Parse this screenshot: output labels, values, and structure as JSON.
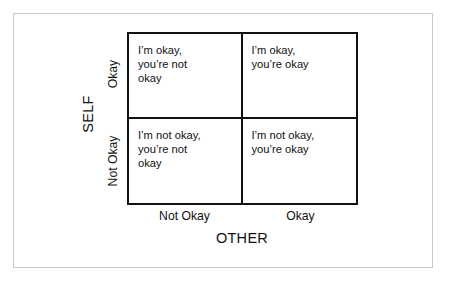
{
  "figure": {
    "title": "",
    "colors": {
      "background": "#ffffff",
      "frame": "#c9c9c9",
      "matrix_border": "#111111",
      "text": "#111111"
    }
  },
  "axes": {
    "y": {
      "title": "SELF",
      "ticks": [
        {
          "key": "okay",
          "label": "Okay"
        },
        {
          "key": "not_okay",
          "label": "Not Okay"
        }
      ]
    },
    "x": {
      "title": "OTHER",
      "ticks": [
        {
          "key": "not_okay",
          "label": "Not Okay"
        },
        {
          "key": "okay",
          "label": "Okay"
        }
      ]
    }
  },
  "chart_data": {
    "type": "table",
    "title": "",
    "xlabel": "OTHER",
    "ylabel": "SELF",
    "grid": true,
    "legend": "none",
    "x_categories": [
      "Not Okay",
      "Okay"
    ],
    "y_categories": [
      "Okay",
      "Not Okay"
    ],
    "cells": [
      {
        "row": "Okay",
        "col": "Not Okay",
        "position": "top-left",
        "text": "I’m okay,\nyou’re not\nokay",
        "lines": [
          "I’m okay,",
          "you’re not",
          "okay"
        ]
      },
      {
        "row": "Okay",
        "col": "Okay",
        "position": "top-right",
        "text": "I’m okay,\nyou’re okay",
        "lines": [
          "I’m okay,",
          "you’re okay"
        ]
      },
      {
        "row": "Not Okay",
        "col": "Not Okay",
        "position": "bottom-left",
        "text": "I’m not okay,\nyou’re not\nokay",
        "lines": [
          "I’m not okay,",
          "you’re not",
          "okay"
        ]
      },
      {
        "row": "Not Okay",
        "col": "Okay",
        "position": "bottom-right",
        "text": "I’m not okay,\nyou’re okay",
        "lines": [
          "I’m not okay,",
          "you’re okay"
        ]
      }
    ]
  }
}
